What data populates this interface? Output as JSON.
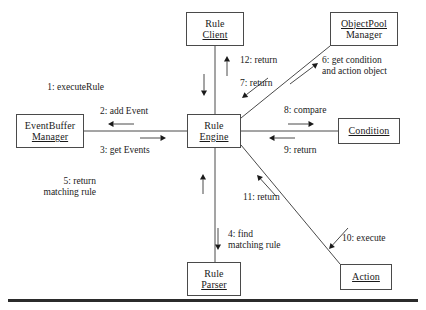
{
  "diagram": {
    "type": "uml-collaboration-diagram",
    "nodes": [
      {
        "id": "rule-client",
        "line1": "Rule",
        "line2": "Client",
        "underline": "line2",
        "x": 186,
        "y": 12,
        "w": 58,
        "h": 34
      },
      {
        "id": "objectpool-manager",
        "line1": "ObjectPool",
        "line2": "Manager",
        "underline": "line1",
        "x": 330,
        "y": 12,
        "w": 68,
        "h": 34
      },
      {
        "id": "eventbuffer-manager",
        "line1": "EventBuffer",
        "line2": "Manager",
        "underline": "line2",
        "x": 16,
        "y": 114,
        "w": 68,
        "h": 34
      },
      {
        "id": "rule-engine",
        "line1": "Rule",
        "line2": "Engine",
        "underline": "line2",
        "x": 187,
        "y": 114,
        "w": 54,
        "h": 34
      },
      {
        "id": "condition",
        "line1": "Condition",
        "line2": "",
        "underline": "line1",
        "x": 338,
        "y": 118,
        "w": 62,
        "h": 26
      },
      {
        "id": "rule-parser",
        "line1": "Rule",
        "line2": "Parser",
        "underline": "line2",
        "x": 187,
        "y": 262,
        "w": 54,
        "h": 34
      },
      {
        "id": "action",
        "line1": "Action",
        "line2": "",
        "underline": "line1",
        "x": 340,
        "y": 264,
        "w": 52,
        "h": 26
      }
    ],
    "messages": [
      {
        "id": "msg-1",
        "seq": "1",
        "line1": "1: executeRule",
        "line2": "",
        "align": "right",
        "x": 104,
        "y": 82,
        "w": 95,
        "direction": "down",
        "from": "rule-client",
        "to": "rule-engine"
      },
      {
        "id": "msg-2",
        "seq": "2",
        "line1": "2: add Event",
        "line2": "",
        "align": "left",
        "x": 100,
        "y": 106,
        "w": 90,
        "direction": "left",
        "from": "rule-engine",
        "to": "eventbuffer-manager"
      },
      {
        "id": "msg-3",
        "seq": "3",
        "line1": "3: get Events",
        "line2": "",
        "align": "left",
        "x": 100,
        "y": 145,
        "w": 90,
        "direction": "right",
        "from": "eventbuffer-manager",
        "to": "rule-engine"
      },
      {
        "id": "msg-4",
        "seq": "4",
        "line1": "4: find",
        "line2": "matching rule",
        "align": "left",
        "x": 228,
        "y": 229,
        "w": 90,
        "direction": "down",
        "from": "rule-engine",
        "to": "rule-parser"
      },
      {
        "id": "msg-5",
        "seq": "5",
        "line1": "5: return",
        "line2": "matching rule",
        "align": "right",
        "x": 96,
        "y": 176,
        "w": 86,
        "direction": "up",
        "from": "rule-parser",
        "to": "rule-engine"
      },
      {
        "id": "msg-6",
        "seq": "6",
        "line1": "6: get condition",
        "line2": "and action object",
        "align": "left",
        "x": 322,
        "y": 55,
        "w": 100,
        "direction": "up-right",
        "from": "rule-engine",
        "to": "objectpool-manager"
      },
      {
        "id": "msg-7",
        "seq": "7",
        "line1": "7: return",
        "line2": "",
        "align": "left",
        "x": 240,
        "y": 78,
        "w": 70,
        "direction": "down-left",
        "from": "objectpool-manager",
        "to": "rule-engine"
      },
      {
        "id": "msg-8",
        "seq": "8",
        "line1": "8: compare",
        "line2": "",
        "align": "left",
        "x": 284,
        "y": 105,
        "w": 80,
        "direction": "right",
        "from": "rule-engine",
        "to": "condition"
      },
      {
        "id": "msg-9",
        "seq": "9",
        "line1": "9: return",
        "line2": "",
        "align": "left",
        "x": 284,
        "y": 145,
        "w": 70,
        "direction": "left",
        "from": "condition",
        "to": "rule-engine"
      },
      {
        "id": "msg-10",
        "seq": "10",
        "line1": "10: execute",
        "line2": "",
        "align": "left",
        "x": 342,
        "y": 233,
        "w": 76,
        "direction": "down-right",
        "from": "rule-engine",
        "to": "action"
      },
      {
        "id": "msg-11",
        "seq": "11",
        "line1": "11: return",
        "line2": "",
        "align": "left",
        "x": 243,
        "y": 192,
        "w": 70,
        "direction": "up-left",
        "from": "action",
        "to": "rule-engine"
      },
      {
        "id": "msg-12",
        "seq": "12",
        "line1": "12: return",
        "line2": "",
        "align": "left",
        "x": 240,
        "y": 55,
        "w": 70,
        "direction": "up",
        "from": "rule-engine",
        "to": "rule-client"
      }
    ],
    "links": [
      {
        "id": "link-client-engine",
        "x1": 215,
        "y1": 46,
        "x2": 215,
        "y2": 114
      },
      {
        "id": "link-engine-parser",
        "x1": 215,
        "y1": 148,
        "x2": 215,
        "y2": 262
      },
      {
        "id": "link-buffer-engine",
        "x1": 84,
        "y1": 131,
        "x2": 187,
        "y2": 131
      },
      {
        "id": "link-engine-condition",
        "x1": 241,
        "y1": 131,
        "x2": 338,
        "y2": 131
      },
      {
        "id": "link-engine-objectpool",
        "x1": 241,
        "y1": 118,
        "x2": 330,
        "y2": 46
      },
      {
        "id": "link-engine-action",
        "x1": 241,
        "y1": 145,
        "x2": 340,
        "y2": 264
      }
    ],
    "arrows": [
      {
        "id": "arrow-1",
        "for": "msg-1",
        "x1": 204,
        "y1": 74,
        "x2": 204,
        "y2": 96
      },
      {
        "id": "arrow-12",
        "for": "msg-12",
        "x1": 227,
        "y1": 76,
        "x2": 227,
        "y2": 56
      },
      {
        "id": "arrow-2",
        "for": "msg-2",
        "x1": 134,
        "y1": 124,
        "x2": 108,
        "y2": 124
      },
      {
        "id": "arrow-3",
        "for": "msg-3",
        "x1": 140,
        "y1": 138,
        "x2": 166,
        "y2": 138
      },
      {
        "id": "arrow-8",
        "for": "msg-8",
        "x1": 288,
        "y1": 124,
        "x2": 314,
        "y2": 124
      },
      {
        "id": "arrow-9",
        "for": "msg-9",
        "x1": 295,
        "y1": 138,
        "x2": 269,
        "y2": 138
      },
      {
        "id": "arrow-5",
        "for": "msg-5",
        "x1": 203,
        "y1": 194,
        "x2": 203,
        "y2": 174
      },
      {
        "id": "arrow-4",
        "for": "msg-4",
        "x1": 218,
        "y1": 228,
        "x2": 218,
        "y2": 250
      },
      {
        "id": "arrow-6",
        "for": "msg-6",
        "x1": 290,
        "y1": 84,
        "x2": 318,
        "y2": 63
      },
      {
        "id": "arrow-7",
        "for": "msg-7",
        "x1": 268,
        "y1": 78,
        "x2": 242,
        "y2": 98
      },
      {
        "id": "arrow-11",
        "for": "msg-11",
        "x1": 276,
        "y1": 196,
        "x2": 257,
        "y2": 175
      },
      {
        "id": "arrow-10",
        "for": "msg-10",
        "x1": 348,
        "y1": 228,
        "x2": 329,
        "y2": 249
      }
    ],
    "style": {
      "stroke": "#4a4a4a",
      "text": "#1a1a1a",
      "background": "#ffffff",
      "rule": "#2b2b2b"
    }
  }
}
